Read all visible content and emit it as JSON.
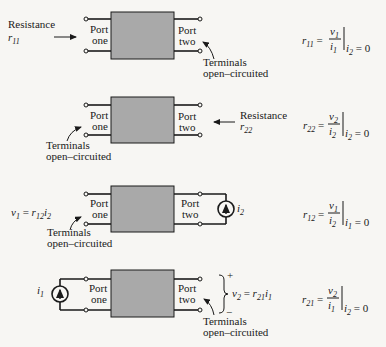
{
  "figure": {
    "port_one_label": [
      "Port",
      "one"
    ],
    "port_two_label": [
      "Port",
      "two"
    ],
    "colors": {
      "box_fill": "#a9a9a9",
      "line": "#1a1a1a",
      "background": "#f7f6f3"
    },
    "rows": [
      {
        "id": "r11",
        "left_annotation": [
          "Resistance",
          "r11"
        ],
        "right_annotation": [
          "Terminals",
          "open–circuited"
        ],
        "equation": {
          "lhs": "r11",
          "num": "v1",
          "den": "i1",
          "condition": "i2 = 0"
        }
      },
      {
        "id": "r22",
        "left_annotation": [
          "Terminals",
          "open–circuited"
        ],
        "right_annotation": [
          "Resistance",
          "r22"
        ],
        "equation": {
          "lhs": "r22",
          "num": "v2",
          "den": "i2",
          "condition": "i2 = 0"
        }
      },
      {
        "id": "r12",
        "left_annotation": [
          "v1 = r12 i2"
        ],
        "left_terminals_note": [
          "Terminals",
          "open–circuited"
        ],
        "source": "i2",
        "equation": {
          "lhs": "r12",
          "num": "v1",
          "den": "i2",
          "condition": "i1 = 0"
        }
      },
      {
        "id": "r21",
        "source": "i1",
        "right_annotation": [
          "+",
          "v2 = r21 i1",
          "−"
        ],
        "right_terminals_note": [
          "Terminals",
          "open–circuited"
        ],
        "equation": {
          "lhs": "r21",
          "num": "v2",
          "den": "i1",
          "condition": "i2 = 0"
        }
      }
    ]
  }
}
